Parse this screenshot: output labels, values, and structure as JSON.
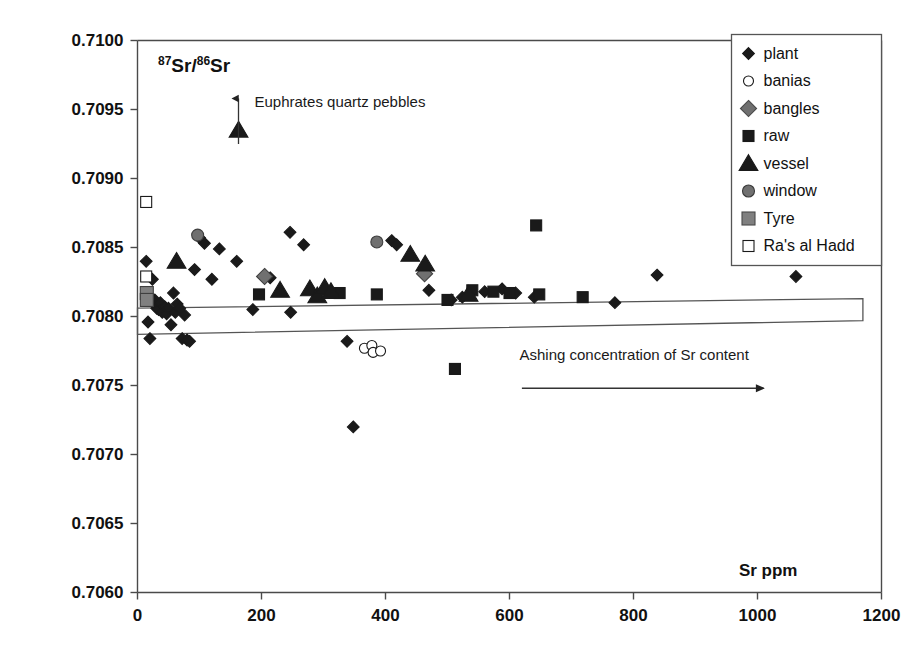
{
  "figure": {
    "title": "",
    "y_axis_label_main": "Sr/",
    "y_axis_label_parts": {
      "sup1": "87",
      "mid1": "Sr/",
      "sup2": "86",
      "mid2": "Sr"
    },
    "x_axis_title": "Sr ppm",
    "annotations": {
      "euphrates": "Euphrates quartz pebbles",
      "ashing_band": "Ashing concentration of Sr content"
    }
  },
  "legend": {
    "position": "top-right",
    "items": [
      {
        "label": "plant",
        "marker": "diamond",
        "fill": "#1a1a1a",
        "stroke": "#1a1a1a"
      },
      {
        "label": "banias",
        "marker": "circle",
        "fill": "#ffffff",
        "stroke": "#1a1a1a"
      },
      {
        "label": "bangles",
        "marker": "diamond",
        "fill": "#707070",
        "stroke": "#4a4a4a"
      },
      {
        "label": "raw",
        "marker": "square",
        "fill": "#1a1a1a",
        "stroke": "#1a1a1a"
      },
      {
        "label": "vessel",
        "marker": "triangle",
        "fill": "#1a1a1a",
        "stroke": "#1a1a1a"
      },
      {
        "label": "window",
        "marker": "circle",
        "fill": "#707070",
        "stroke": "#3a3a3a"
      },
      {
        "label": "Tyre",
        "marker": "square",
        "fill": "#808080",
        "stroke": "#4a4a4a"
      },
      {
        "label": "Ra's al Hadd",
        "marker": "square",
        "fill": "#ffffff",
        "stroke": "#1a1a1a"
      }
    ]
  },
  "chart_data": {
    "type": "scatter",
    "title": "",
    "xlabel": "Sr ppm",
    "ylabel": "87Sr/86Sr",
    "xlim": [
      0,
      1200
    ],
    "ylim": [
      0.706,
      0.71
    ],
    "xticks": [
      0,
      200,
      400,
      600,
      800,
      1000,
      1200
    ],
    "xtick_labels": [
      "0",
      "200",
      "400",
      "600",
      "800",
      "1000",
      "1200"
    ],
    "yticks": [
      0.706,
      0.7065,
      0.707,
      0.7075,
      0.708,
      0.7085,
      0.709,
      0.7095,
      0.71
    ],
    "ytick_labels": [
      "0.7060",
      "0.7065",
      "0.7070",
      "0.7075",
      "0.7080",
      "0.7085",
      "0.7090",
      "0.7095",
      "0.7100"
    ],
    "grid": false,
    "legend_position": "top-right",
    "series": [
      {
        "name": "plant",
        "marker": "diamond",
        "fill": "#1a1a1a",
        "points": [
          [
            14,
            0.7084
          ],
          [
            17,
            0.70796
          ],
          [
            20,
            0.70784
          ],
          [
            24,
            0.70827
          ],
          [
            28,
            0.70812
          ],
          [
            31,
            0.70806
          ],
          [
            34,
            0.70805
          ],
          [
            37,
            0.7081
          ],
          [
            40,
            0.70803
          ],
          [
            44,
            0.70807
          ],
          [
            47,
            0.70802
          ],
          [
            50,
            0.70806
          ],
          [
            54,
            0.70794
          ],
          [
            58,
            0.70817
          ],
          [
            61,
            0.70803
          ],
          [
            64,
            0.70809
          ],
          [
            68,
            0.70806
          ],
          [
            72,
            0.70784
          ],
          [
            76,
            0.70801
          ],
          [
            80,
            0.70783
          ],
          [
            84,
            0.70782
          ],
          [
            92,
            0.70834
          ],
          [
            100,
            0.70857
          ],
          [
            108,
            0.70853
          ],
          [
            120,
            0.70827
          ],
          [
            132,
            0.70849
          ],
          [
            160,
            0.7084
          ],
          [
            186,
            0.70805
          ],
          [
            214,
            0.70828
          ],
          [
            246,
            0.70861
          ],
          [
            247,
            0.70803
          ],
          [
            268,
            0.70852
          ],
          [
            338,
            0.70782
          ],
          [
            348,
            0.7072
          ],
          [
            410,
            0.70855
          ],
          [
            418,
            0.70852
          ],
          [
            470,
            0.70819
          ],
          [
            506,
            0.70812
          ],
          [
            524,
            0.70814
          ],
          [
            560,
            0.70818
          ],
          [
            588,
            0.7082
          ],
          [
            610,
            0.70817
          ],
          [
            640,
            0.70814
          ],
          [
            770,
            0.7081
          ],
          [
            838,
            0.7083
          ],
          [
            1062,
            0.70829
          ]
        ]
      },
      {
        "name": "banias",
        "marker": "circle",
        "fill": "#ffffff",
        "points": [
          [
            366,
            0.70777
          ],
          [
            378,
            0.70779
          ],
          [
            380,
            0.70774
          ],
          [
            392,
            0.70775
          ]
        ]
      },
      {
        "name": "bangles",
        "marker": "diamond",
        "fill": "#707070",
        "points": [
          [
            205,
            0.70829
          ],
          [
            463,
            0.70831
          ]
        ]
      },
      {
        "name": "raw",
        "marker": "square",
        "fill": "#1a1a1a",
        "points": [
          [
            196,
            0.70816
          ],
          [
            326,
            0.70817
          ],
          [
            386,
            0.70816
          ],
          [
            500,
            0.70812
          ],
          [
            512,
            0.70762
          ],
          [
            540,
            0.70819
          ],
          [
            574,
            0.70818
          ],
          [
            600,
            0.70817
          ],
          [
            643,
            0.70866
          ],
          [
            648,
            0.70816
          ],
          [
            718,
            0.70814
          ]
        ]
      },
      {
        "name": "vessel",
        "marker": "triangle",
        "fill": "#1a1a1a",
        "points": [
          [
            63,
            0.7084
          ],
          [
            163,
            0.70935
          ],
          [
            230,
            0.70819
          ],
          [
            278,
            0.7082
          ],
          [
            290,
            0.70815
          ],
          [
            302,
            0.70821
          ],
          [
            312,
            0.70818
          ],
          [
            440,
            0.70845
          ],
          [
            464,
            0.70838
          ],
          [
            534,
            0.70816
          ]
        ]
      },
      {
        "name": "window",
        "marker": "circle",
        "fill": "#707070",
        "points": [
          [
            97,
            0.70859
          ],
          [
            386,
            0.70854
          ]
        ]
      },
      {
        "name": "Tyre",
        "marker": "square",
        "fill": "#808080",
        "points": [
          [
            15,
            0.70817
          ],
          [
            15,
            0.70812
          ]
        ]
      },
      {
        "name": "Ra's al Hadd",
        "marker": "square",
        "fill": "#ffffff",
        "points": [
          [
            14,
            0.70883
          ],
          [
            14,
            0.70829
          ]
        ]
      }
    ],
    "bands": [
      {
        "name": "ashing-concentration-band",
        "label": "Ashing concentration of Sr content",
        "x_range": [
          0,
          1170
        ],
        "y_range_left": [
          0.70787,
          0.70806
        ],
        "y_range_right": [
          0.70797,
          0.70813
        ]
      }
    ],
    "arrows": [
      {
        "name": "euphrates-arrow",
        "x": 200,
        "y_from": 0.70925,
        "y_to": 0.70958,
        "direction": "up"
      },
      {
        "name": "ashing-arrow",
        "x_from": 620,
        "x_to": 1010,
        "y": 0.70748,
        "direction": "right"
      }
    ]
  }
}
